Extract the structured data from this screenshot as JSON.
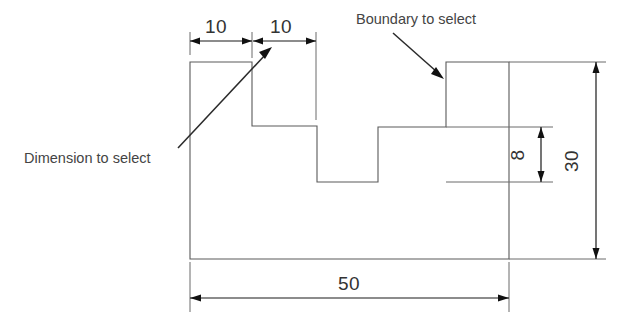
{
  "drawing": {
    "title": "Engineering profile with dimensions and annotation callouts",
    "background_color": "#ffffff",
    "line_color": "#5a5a5a",
    "dimension_color": "#1a1a1a",
    "text_color": "#333333"
  },
  "dimensions": [
    {
      "id": "dim-10-left",
      "value": "10",
      "orientation": "horizontal",
      "position": "top",
      "label_x": 216,
      "label_y": 33
    },
    {
      "id": "dim-10-right",
      "value": "10",
      "orientation": "horizontal",
      "position": "top",
      "label_x": 278,
      "label_y": 33
    },
    {
      "id": "dim-8",
      "value": "8",
      "orientation": "vertical",
      "position": "inner-right",
      "label_x": 527,
      "label_y": 163
    },
    {
      "id": "dim-30",
      "value": "30",
      "orientation": "vertical",
      "position": "right",
      "label_x": 583,
      "label_y": 172
    },
    {
      "id": "dim-50",
      "value": "50",
      "orientation": "horizontal",
      "position": "bottom",
      "label_x": 349,
      "label_y": 290
    }
  ],
  "annotations": [
    {
      "id": "note-dimension",
      "text": "Dimension to select",
      "label_x": 24,
      "label_y": 163,
      "leader_from_x": 178,
      "leader_from_y": 148,
      "leader_to_x": 271,
      "leader_to_y": 49
    },
    {
      "id": "note-boundary",
      "text": "Boundary to select",
      "label_x": 356,
      "label_y": 24,
      "leader_from_x": 393,
      "leader_from_y": 33,
      "leader_to_x": 443,
      "leader_to_y": 79
    }
  ],
  "profile": {
    "description": "Stepped block outline",
    "path": "M 190 62 L 252 62 L 252 126 L 317 126 L 317 182 L 378 182 L 378 127 L 446 127 L 446 62 L 509 62 L 509 259 L 190 259 Z"
  }
}
